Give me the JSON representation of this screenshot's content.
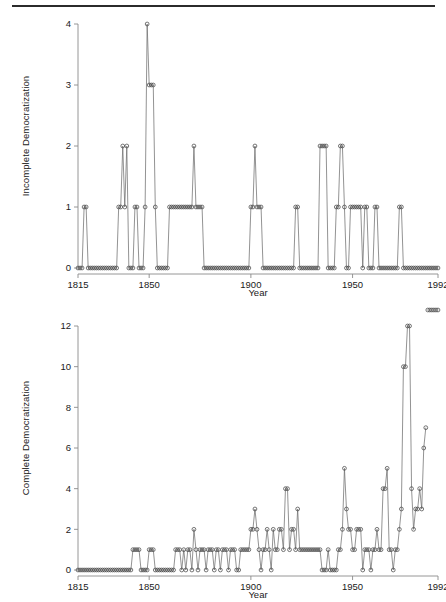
{
  "page": {
    "divider": true,
    "background": "#ffffff",
    "line_color": "#6f6f6f",
    "axis_color": "#8a8a8a",
    "marker_color": "#4a4a4a"
  },
  "chart_data": [
    {
      "type": "line",
      "title": "",
      "subtitle": "",
      "xlabel": "Year",
      "ylabel": "Incomplete Democratization",
      "xlim": [
        1815,
        1992
      ],
      "ylim": [
        0,
        4
      ],
      "xticks": [
        1815,
        1850,
        1900,
        1950,
        1992
      ],
      "xticklabels": [
        "1815",
        "1850",
        "1900",
        "1950",
        "1992"
      ],
      "yticks": [
        0,
        1,
        2,
        3,
        4
      ],
      "yticklabels": [
        "0",
        "1",
        "2",
        "3",
        "4"
      ],
      "grid": false,
      "legend": false,
      "marker": "open-circle",
      "x": [
        1815,
        1816,
        1817,
        1818,
        1819,
        1820,
        1821,
        1822,
        1823,
        1824,
        1825,
        1826,
        1827,
        1828,
        1829,
        1830,
        1831,
        1832,
        1833,
        1834,
        1835,
        1836,
        1837,
        1838,
        1839,
        1840,
        1841,
        1842,
        1843,
        1844,
        1845,
        1846,
        1847,
        1848,
        1849,
        1850,
        1851,
        1852,
        1853,
        1854,
        1855,
        1856,
        1857,
        1858,
        1859,
        1860,
        1861,
        1862,
        1863,
        1864,
        1865,
        1866,
        1867,
        1868,
        1869,
        1870,
        1871,
        1872,
        1873,
        1874,
        1875,
        1876,
        1877,
        1878,
        1879,
        1880,
        1881,
        1882,
        1883,
        1884,
        1885,
        1886,
        1887,
        1888,
        1889,
        1890,
        1891,
        1892,
        1893,
        1894,
        1895,
        1896,
        1897,
        1898,
        1899,
        1900,
        1901,
        1902,
        1903,
        1904,
        1905,
        1906,
        1907,
        1908,
        1909,
        1910,
        1911,
        1912,
        1913,
        1914,
        1915,
        1916,
        1917,
        1918,
        1919,
        1920,
        1921,
        1922,
        1923,
        1924,
        1925,
        1926,
        1927,
        1928,
        1929,
        1930,
        1931,
        1932,
        1933,
        1934,
        1935,
        1936,
        1937,
        1938,
        1939,
        1940,
        1941,
        1942,
        1943,
        1944,
        1945,
        1946,
        1947,
        1948,
        1949,
        1950,
        1951,
        1952,
        1953,
        1954,
        1955,
        1956,
        1957,
        1958,
        1959,
        1960,
        1961,
        1962,
        1963,
        1964,
        1965,
        1966,
        1967,
        1968,
        1969,
        1970,
        1971,
        1972,
        1973,
        1974,
        1975,
        1976,
        1977,
        1978,
        1979,
        1980,
        1981,
        1982,
        1983,
        1984,
        1985,
        1986,
        1987,
        1988,
        1989,
        1990,
        1991,
        1992
      ],
      "y": [
        0,
        0,
        0,
        1,
        1,
        0,
        0,
        0,
        0,
        0,
        0,
        0,
        0,
        0,
        0,
        0,
        0,
        0,
        0,
        0,
        1,
        1,
        2,
        1,
        2,
        0,
        0,
        0,
        1,
        1,
        0,
        0,
        0,
        1,
        4,
        3,
        3,
        3,
        1,
        0,
        0,
        0,
        0,
        0,
        0,
        1,
        1,
        1,
        1,
        1,
        1,
        1,
        1,
        1,
        1,
        1,
        1,
        2,
        1,
        1,
        1,
        1,
        0,
        0,
        0,
        0,
        0,
        0,
        0,
        0,
        0,
        0,
        0,
        0,
        0,
        0,
        0,
        0,
        0,
        0,
        0,
        0,
        0,
        0,
        0,
        1,
        1,
        2,
        1,
        1,
        1,
        0,
        0,
        0,
        0,
        0,
        0,
        0,
        0,
        0,
        0,
        0,
        0,
        0,
        0,
        0,
        0,
        1,
        1,
        0,
        0,
        0,
        0,
        0,
        0,
        0,
        0,
        0,
        0,
        2,
        2,
        2,
        2,
        0,
        0,
        0,
        0,
        1,
        1,
        2,
        2,
        1,
        0,
        0,
        1,
        1,
        1,
        1,
        1,
        1,
        0,
        1,
        1,
        0,
        0,
        0,
        1,
        1,
        0,
        0,
        0,
        0,
        0,
        0,
        0,
        0,
        0,
        0,
        1,
        1,
        0,
        0,
        0,
        0,
        0,
        0,
        0,
        0,
        0,
        0,
        0,
        0,
        0,
        0,
        0,
        0,
        0,
        0
      ]
    },
    {
      "type": "line",
      "title": "",
      "subtitle": "",
      "xlabel": "Year",
      "ylabel": "Complete Democratization",
      "xlim": [
        1815,
        1992
      ],
      "ylim": [
        0,
        12
      ],
      "xticks": [
        1815,
        1850,
        1900,
        1950,
        1992
      ],
      "xticklabels": [
        "1815",
        "1850",
        "1900",
        "1950",
        "1992"
      ],
      "yticks": [
        0,
        2,
        4,
        6,
        8,
        10,
        12
      ],
      "yticklabels": [
        "0",
        "2",
        "4",
        "6",
        "8",
        "10",
        "12"
      ],
      "grid": false,
      "legend": false,
      "marker": "open-circle",
      "x": [
        1815,
        1816,
        1817,
        1818,
        1819,
        1820,
        1821,
        1822,
        1823,
        1824,
        1825,
        1826,
        1827,
        1828,
        1829,
        1830,
        1831,
        1832,
        1833,
        1834,
        1835,
        1836,
        1837,
        1838,
        1839,
        1840,
        1841,
        1842,
        1843,
        1844,
        1845,
        1846,
        1847,
        1848,
        1849,
        1850,
        1851,
        1852,
        1853,
        1854,
        1855,
        1856,
        1857,
        1858,
        1859,
        1860,
        1861,
        1862,
        1863,
        1864,
        1865,
        1866,
        1867,
        1868,
        1869,
        1870,
        1871,
        1872,
        1873,
        1874,
        1875,
        1876,
        1877,
        1878,
        1879,
        1880,
        1881,
        1882,
        1883,
        1884,
        1885,
        1886,
        1887,
        1888,
        1889,
        1890,
        1891,
        1892,
        1893,
        1894,
        1895,
        1896,
        1897,
        1898,
        1899,
        1900,
        1901,
        1902,
        1903,
        1904,
        1905,
        1906,
        1907,
        1908,
        1909,
        1910,
        1911,
        1912,
        1913,
        1914,
        1915,
        1916,
        1917,
        1918,
        1919,
        1920,
        1921,
        1922,
        1923,
        1924,
        1925,
        1926,
        1927,
        1928,
        1929,
        1930,
        1931,
        1932,
        1933,
        1934,
        1935,
        1936,
        1937,
        1938,
        1939,
        1940,
        1941,
        1942,
        1943,
        1944,
        1945,
        1946,
        1947,
        1948,
        1949,
        1950,
        1951,
        1952,
        1953,
        1954,
        1955,
        1956,
        1957,
        1958,
        1959,
        1960,
        1961,
        1962,
        1963,
        1964,
        1965,
        1966,
        1967,
        1968,
        1969,
        1970,
        1971,
        1972,
        1973,
        1974,
        1975,
        1976,
        1977,
        1978,
        1979,
        1980,
        1981,
        1982,
        1983,
        1984,
        1985,
        1986,
        1987,
        1988,
        1989,
        1990,
        1991,
        1992
      ],
      "y": [
        0,
        0,
        0,
        0,
        0,
        0,
        0,
        0,
        0,
        0,
        0,
        0,
        0,
        0,
        0,
        0,
        0,
        0,
        0,
        0,
        0,
        0,
        0,
        0,
        0,
        0,
        0,
        1,
        1,
        1,
        1,
        0,
        0,
        0,
        0,
        1,
        1,
        1,
        0,
        0,
        0,
        0,
        0,
        0,
        0,
        0,
        0,
        0,
        1,
        1,
        1,
        0,
        1,
        0,
        1,
        1,
        0,
        2,
        1,
        0,
        1,
        1,
        1,
        0,
        1,
        1,
        1,
        0,
        1,
        1,
        0,
        1,
        1,
        1,
        0,
        1,
        1,
        1,
        0,
        0,
        1,
        1,
        1,
        1,
        1,
        2,
        2,
        3,
        2,
        1,
        0,
        1,
        1,
        2,
        1,
        0,
        2,
        1,
        1,
        2,
        2,
        1,
        4,
        4,
        1,
        2,
        2,
        1,
        3,
        1,
        1,
        1,
        1,
        1,
        1,
        1,
        1,
        1,
        1,
        1,
        0,
        0,
        0,
        1,
        0,
        0,
        0,
        0,
        1,
        1,
        2,
        5,
        3,
        2,
        2,
        1,
        1,
        2,
        2,
        2,
        0,
        1,
        1,
        1,
        0,
        1,
        1,
        2,
        1,
        1,
        4,
        4,
        5,
        1,
        1,
        0,
        1,
        1,
        2,
        3,
        10,
        10,
        12,
        12,
        4,
        2,
        3,
        3,
        4,
        3,
        6,
        7
      ]
    }
  ]
}
